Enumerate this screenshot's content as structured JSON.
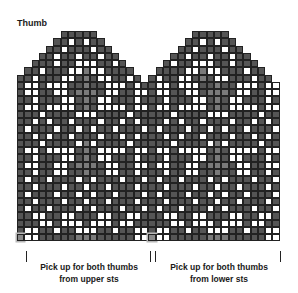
{
  "title": "Thumb",
  "labels": {
    "left": {
      "line1": "Pick up for both thumbs",
      "line2": "from upper sts"
    },
    "right": {
      "line1": "Pick up for both thumbs",
      "line2": "from lower sts"
    }
  },
  "colors": {
    "dark": "#555555",
    "white": "#ffffff",
    "contrast": "#7a7a7a",
    "marker": "#8a8a8a",
    "grid": "#222222"
  },
  "legend_key": {
    "D": "dark stitch",
    "W": "white stitch",
    "L": "contrast stitch",
    "M": "marker stitch",
    ".": "no stitch"
  },
  "chart_data": {
    "type": "table",
    "title": "Thumb",
    "columns": 36,
    "rows": [
      "......DDDDD.............DDDDD.......",
      ".....DDWDWDD...........DDWDWDD......",
      "....DDWDDDWDD.........DDWDDDWDD.....",
      "...DDWDDWDDWDD.......DDWDDWDDWDD....",
      "..DDDWDDWWWDDWD.....DWDDWWWDDWDDD...",
      ".DDWDDDWWLWWDDDD...DDDDWWLWWDDDWDD..",
      "DDWDDDWWDLDWWDDWD.DWDDWWDLDWWDDDWDD.",
      "DWWDWWWDDLDDWWWDWDDWWDWWWDDLDDWWWDWW",
      "DWWDDWWDLLLDWWDDWWDWWDDWWDLLLDWWDDWW",
      "DDWDDDWWDLDWWDDDWDDDWDDDWWDLDWWDDDWD",
      "DWWDWWWWDLDWWWWDWWDWWDWWWWDLDWWWWDWW",
      "DDDWDDDDWWWDDDDWDDDDDWDDDDWWWDDDDWDD",
      "DDWDWDDWDDDWDDWDWDDDWDWDDWDDDWDDWDWD",
      "DWDDDWDDWDWDDWDDDWDWDDDWDDWDWDDWDDDW",
      "DDWDWDDWDDDWDDWDWDDDWDWDDWDDDWDDWDWD",
      "DDDWDDDDWLWDDDDWDDDDDWDDDDWLWDDDDWDD",
      "DWWDWWWWDLDWWWWDWWDWWDWWWWDLDWWWWDWW",
      "DDWDDDWWDLDWWDDDWDDDWDDDWWDLDWWDDDWD",
      "DWWDDWWDLLLDWWDDWWDWWDDWWDLLLDWWDDWW",
      "DDWDDWWDDLDDWWDDWDDDWDDWWDDLDDWWDDWD",
      "DWDDWDDDWDWDDDWDDWDWDDWDDDWDWDDDWDDW",
      "DDWDDDWDDWDDWDDDWDDDWDDDWDDWDDWDDDWD",
      "DWDDDWDDWDWDDWDDDWDWDDDWDDWDWDDWDDDW",
      "DDWDDDWDDWDDWDDDWDDDWDDDWDDWDDWDDDWD",
      "DWDDWDDDWDWDDDWDDWDWDDWDDDWDWDDDWDDW",
      "DDWWDDWWDDDWWDDWWDDDWWDDWWDDDWWDDWWD",
      "DDDWWDWWWDWWWDWWDDDDDWWDWWWDWWWDWWDD",
      "DWWDDWDDWWWDDWDDWWDWWDDWDDWWWDDWDDWW",
      "MWWDDDDDLLLDDDDDWWMWWDDDDDLLLDDDDDWW"
    ]
  }
}
